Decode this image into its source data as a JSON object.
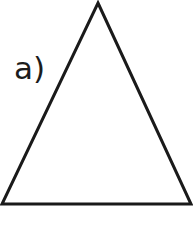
{
  "figure": {
    "panel_label": "a)",
    "background_color": "#ffffff",
    "stroke_color": "#1a1a1a",
    "label_color": "#1c1c1c",
    "stroke_width": 3,
    "width": 193,
    "height": 226,
    "shape": {
      "name": "triangle",
      "type": "isosceles-triangle",
      "fill": "none",
      "points": "98,3 191,204 2,204",
      "vertices": [
        {
          "name": "apex",
          "x": 98,
          "y": 3
        },
        {
          "name": "bottom-right",
          "x": 191,
          "y": 204
        },
        {
          "name": "bottom-left",
          "x": 2,
          "y": 204
        }
      ]
    }
  }
}
